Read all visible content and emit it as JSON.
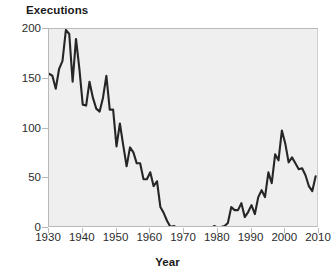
{
  "chart_data": {
    "type": "line",
    "title": "",
    "xlabel": "Year",
    "ylabel": "Executions",
    "xlim": [
      1930,
      2010
    ],
    "ylim": [
      0,
      200
    ],
    "grid": false,
    "legend": null,
    "line_color": "#262626",
    "plot_background": "#efefef",
    "axis_color": "#b9b9b9",
    "xticks": [
      1930,
      1940,
      1950,
      1960,
      1970,
      1980,
      1990,
      2000,
      2010
    ],
    "yticks": [
      0,
      50,
      100,
      150,
      200
    ],
    "xtick_labels": [
      "1930",
      "1940",
      "1950",
      "1960",
      "1970",
      "1980",
      "1990",
      "2000",
      "2010"
    ],
    "ytick_labels": [
      "0",
      "50",
      "100",
      "150",
      "200"
    ],
    "series": [
      {
        "name": "Executions",
        "x": [
          1930,
          1931,
          1932,
          1933,
          1934,
          1935,
          1936,
          1937,
          1938,
          1939,
          1940,
          1941,
          1942,
          1943,
          1944,
          1945,
          1946,
          1947,
          1948,
          1949,
          1950,
          1951,
          1952,
          1953,
          1954,
          1955,
          1956,
          1957,
          1958,
          1959,
          1960,
          1961,
          1962,
          1963,
          1964,
          1965,
          1966,
          1967,
          1968,
          1969,
          1970,
          1971,
          1972,
          1973,
          1974,
          1975,
          1976,
          1977,
          1978,
          1979,
          1980,
          1981,
          1982,
          1983,
          1984,
          1985,
          1986,
          1987,
          1988,
          1989,
          1990,
          1991,
          1992,
          1993,
          1994,
          1995,
          1996,
          1997,
          1998,
          1999,
          2000,
          2001,
          2002,
          2003,
          2004,
          2005,
          2006,
          2007,
          2008,
          2009
        ],
        "values": [
          155,
          153,
          140,
          160,
          168,
          199,
          195,
          147,
          190,
          160,
          124,
          123,
          147,
          131,
          120,
          117,
          131,
          153,
          119,
          119,
          82,
          105,
          83,
          62,
          81,
          76,
          65,
          65,
          49,
          49,
          56,
          42,
          47,
          21,
          15,
          7,
          1,
          2,
          0,
          0,
          0,
          0,
          0,
          0,
          0,
          0,
          0,
          1,
          0,
          2,
          0,
          1,
          2,
          5,
          21,
          18,
          18,
          25,
          11,
          16,
          23,
          14,
          31,
          38,
          31,
          56,
          45,
          74,
          68,
          98,
          85,
          66,
          71,
          65,
          59,
          60,
          53,
          42,
          37,
          52
        ]
      }
    ]
  },
  "watermark": {
    "text": "                                                                                                                                                                                                                                                                  "
  }
}
